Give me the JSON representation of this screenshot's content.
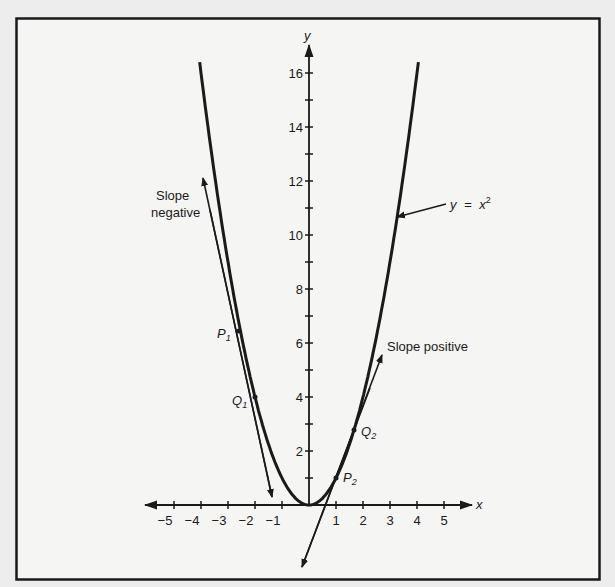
{
  "chart_data": {
    "type": "line",
    "title": "",
    "xlabel": "x",
    "ylabel": "y",
    "xlim": [
      -5,
      5
    ],
    "ylim": [
      0,
      16
    ],
    "x_ticks": [
      -5,
      -4,
      -3,
      -2,
      -1,
      1,
      2,
      3,
      4,
      5
    ],
    "x_tick_labels": [
      "−5",
      "−4",
      "−3",
      "−2",
      "−1",
      "1",
      "2",
      "3",
      "4",
      "5"
    ],
    "y_ticks": [
      1,
      2,
      3,
      4,
      5,
      6,
      7,
      8,
      9,
      10,
      11,
      12,
      13,
      14,
      15,
      16
    ],
    "y_tick_labels": [
      "2",
      "4",
      "6",
      "8",
      "10",
      "12",
      "14",
      "16"
    ],
    "y_labeled_ticks": [
      2,
      4,
      6,
      8,
      10,
      12,
      14,
      16
    ],
    "grid": false,
    "series": [
      {
        "name": "y = x²",
        "function": "x^2",
        "x": [
          -4,
          -3,
          -2,
          -1,
          0,
          1,
          2,
          3,
          4
        ],
        "values": [
          16,
          9,
          4,
          1,
          0,
          1,
          4,
          9,
          16
        ]
      }
    ],
    "points": [
      {
        "label": "P",
        "sub": "1",
        "x": -2.55,
        "y": 6.5
      },
      {
        "label": "Q",
        "sub": "1",
        "x": -2.0,
        "y": 4.0
      },
      {
        "label": "P",
        "sub": "2",
        "x": 1.0,
        "y": 1.0
      },
      {
        "label": "Q",
        "sub": "2",
        "x": 1.65,
        "y": 2.72
      }
    ],
    "secant_lines": [
      {
        "name": "Slope negative",
        "through": [
          "P1",
          "Q1"
        ],
        "from": [
          -3.92,
          12.2
        ],
        "to": [
          -1.35,
          0.3
        ]
      },
      {
        "name": "Slope positive",
        "through": [
          "P2",
          "Q2"
        ],
        "from": [
          -0.26,
          -2.3
        ],
        "to": [
          2.7,
          5.6
        ]
      }
    ],
    "annotations": [
      {
        "text_line1": "Slope",
        "text_line2": "negative"
      },
      {
        "text": "Slope positive"
      },
      {
        "text": "y = x²",
        "y_part": "y",
        "eq": "=",
        "x_part": "x",
        "sup": "2"
      }
    ]
  },
  "axes": {
    "x_label": "x",
    "y_label": "y"
  },
  "labels": {
    "slope_negative_1": "Slope",
    "slope_negative_2": "negative",
    "slope_positive": "Slope positive",
    "curve_y": "y",
    "curve_eq": "=",
    "curve_x": "x",
    "curve_sup": "2",
    "p1": "P",
    "p1_sub": "1",
    "q1": "Q",
    "q1_sub": "1",
    "p2": "P",
    "p2_sub": "2",
    "q2": "Q",
    "q2_sub": "2"
  },
  "colors": {
    "background": "#ededed",
    "panel": "#f5f5f4",
    "ink": "#1a1a1a"
  }
}
